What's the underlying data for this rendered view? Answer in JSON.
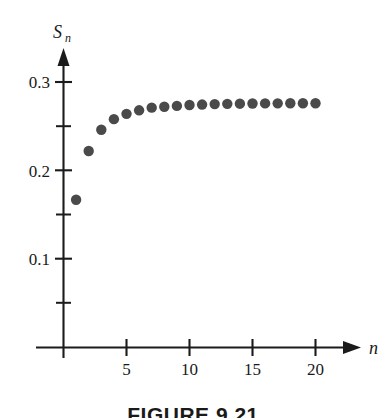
{
  "figure": {
    "caption": "FIGURE 9.21",
    "caption_clipped": true
  },
  "axes": {
    "y_title": "S",
    "y_title_subscript": "n",
    "x_title": "n",
    "y_tick_labels": [
      "0.3",
      "0.2",
      "0.1"
    ],
    "x_tick_labels": [
      "5",
      "10",
      "15",
      "20"
    ]
  },
  "chart_data": {
    "type": "scatter",
    "title": "",
    "xlabel": "n",
    "ylabel": "S_n",
    "grid": false,
    "legend": null,
    "marker": {
      "shape": "circle",
      "color": "#4a4a4a",
      "radius_px": 5.2
    },
    "axis_style": {
      "x_axis_arrow": true,
      "y_axis_arrow": true,
      "spine_color": "#1b1b1b"
    },
    "xlim": [
      0,
      22.5
    ],
    "ylim": [
      0,
      0.335
    ],
    "x_major_ticks": [
      5,
      10,
      15,
      20
    ],
    "x_minor_ticks": [],
    "y_major_ticks": [
      0.1,
      0.2,
      0.3
    ],
    "y_minor_ticks": [
      0.05,
      0.15,
      0.25
    ],
    "x": [
      1,
      2,
      3,
      4,
      5,
      6,
      7,
      8,
      9,
      10,
      11,
      12,
      13,
      14,
      15,
      16,
      17,
      18,
      19,
      20
    ],
    "y": [
      0.167,
      0.222,
      0.246,
      0.258,
      0.264,
      0.268,
      0.271,
      0.272,
      0.273,
      0.274,
      0.2745,
      0.275,
      0.2753,
      0.2755,
      0.2757,
      0.2758,
      0.2759,
      0.276,
      0.276,
      0.276
    ],
    "series": [
      {
        "name": "S_n",
        "values": [
          0.167,
          0.222,
          0.246,
          0.258,
          0.264,
          0.268,
          0.271,
          0.272,
          0.273,
          0.274,
          0.2745,
          0.275,
          0.2753,
          0.2755,
          0.2757,
          0.2758,
          0.2759,
          0.276,
          0.276,
          0.276
        ]
      }
    ],
    "convergence_value": 0.276
  }
}
